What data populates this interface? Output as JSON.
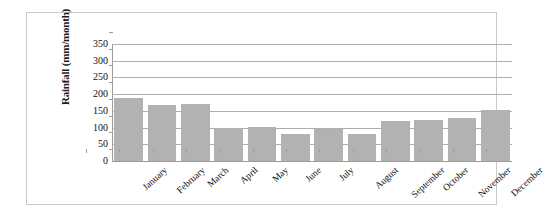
{
  "chart_data": {
    "type": "bar",
    "title": "",
    "subtitle": "",
    "xlabel": "",
    "ylabel": "Rainfall (mm/month)",
    "ylim": [
      0,
      350
    ],
    "yticks": [
      0,
      50,
      100,
      150,
      200,
      250,
      300,
      350
    ],
    "ytick_labels": [
      "0",
      "50",
      "100",
      "150",
      "200",
      "250",
      "300",
      "350"
    ],
    "grid": true,
    "legend": false,
    "legend_position": "none",
    "bar_color": "#b2b2b2",
    "gridline_color": "#aeaeae",
    "axis_color": "#9c9c9c",
    "frame_color": "#c9c9c9",
    "categories": [
      "January",
      "February",
      "March",
      "April",
      "May",
      "June",
      "July",
      "August",
      "September",
      "October",
      "November",
      "December"
    ],
    "values": [
      188,
      168,
      170,
      99,
      101,
      80,
      95,
      81,
      119,
      123,
      130,
      152
    ]
  }
}
